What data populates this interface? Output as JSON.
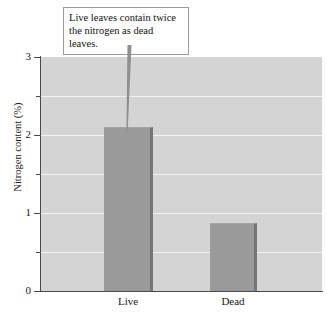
{
  "chart_data": {
    "type": "bar",
    "title": "",
    "subtitle": "",
    "xlabel": "",
    "ylabel": "Nitrogen content (%)",
    "categories": [
      "Live",
      "Dead"
    ],
    "values": [
      2.1,
      0.87
    ],
    "series": [
      {
        "name": "Nitrogen content",
        "values": [
          2.1,
          0.87
        ]
      }
    ],
    "ylim": [
      0,
      3
    ],
    "xlim_categories": 2,
    "y_ticks_major": [
      0,
      1,
      2,
      3
    ],
    "y_tick_labels": [
      "0",
      "1",
      "2",
      "3"
    ],
    "y_ticks_minor": [
      0.5,
      1.5,
      2.5
    ],
    "gridlines": [
      0.5,
      1,
      1.5,
      2,
      2.5
    ],
    "grid": true,
    "legend": "none",
    "annotations": [
      {
        "text": "Live leaves contain twice the nitrogen as dead leaves.",
        "points_to": "Live"
      }
    ],
    "colors": {
      "plot_background": "#d4d4d4",
      "bar_fill": "#9a9a9a",
      "bar_shadow": "#767676",
      "gridline": "#f2f2f2",
      "axis": "#4a4a4a",
      "callout_background": "#ffffff",
      "callout_border": "#9b9b9b",
      "text": "#1a1a1a"
    }
  },
  "axis": {
    "y_title": "Nitrogen content (%)",
    "y_labels": [
      "3",
      "2",
      "1",
      "0"
    ],
    "x_labels": [
      "Live",
      "Dead"
    ]
  },
  "callout": {
    "line_1": "Live leaves contain twice",
    "line_2": "the nitrogen as dead leaves."
  }
}
